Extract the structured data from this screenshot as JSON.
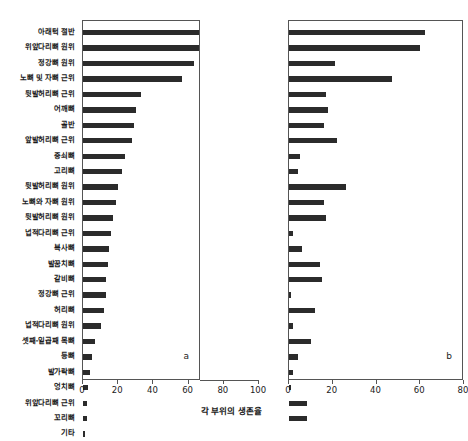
{
  "chart_data": {
    "type": "bar",
    "title": "",
    "xlabel": "각 부위의 생존율",
    "ylabel": "",
    "orientation": "horizontal",
    "grid": false,
    "legend": false,
    "categories": [
      "아래턱 절반",
      "위앞다리뼈 원위",
      "정강뼈 원위",
      "노뼈 및 자뼈 근위",
      "뒷발허리뼈 근위",
      "어깨뼈",
      "골반",
      "앞발허리뼈 근위",
      "중쇠뼈",
      "고리뼈",
      "뒷발허리뼈 원위",
      "노뼈와 자뼈 원위",
      "뒷발허리뼈 원위",
      "넙적다리뼈 근위",
      "복사뼈",
      "발꿈치뼈",
      "갈비뼈",
      "정강뼈 근위",
      "허리뼈",
      "넙적다리뼈 원위",
      "셋째-일곱째 목뼈",
      "등뼈",
      "발가락뼈",
      "엉치뼈",
      "위앞다리뼈 근위",
      "꼬리뼈",
      "기타"
    ],
    "panels": [
      {
        "tag": "a",
        "xlim": [
          0,
          100
        ],
        "xticks": [
          0,
          20,
          40,
          60,
          80,
          100
        ],
        "values": [
          94,
          70,
          63,
          56,
          33,
          30,
          29,
          28,
          24,
          22,
          20,
          19,
          17,
          16,
          15,
          14,
          13,
          13,
          12,
          10,
          7,
          5,
          4,
          3,
          2,
          2,
          1
        ]
      },
      {
        "tag": "b",
        "xlim": [
          0,
          80
        ],
        "xticks": [
          0,
          20,
          40,
          60,
          80
        ],
        "values": [
          62,
          60,
          21,
          47,
          17,
          18,
          16,
          22,
          5,
          4,
          26,
          16,
          17,
          2,
          6,
          14,
          15,
          1,
          12,
          2,
          10,
          4,
          2,
          1,
          8,
          8,
          0
        ]
      }
    ]
  }
}
